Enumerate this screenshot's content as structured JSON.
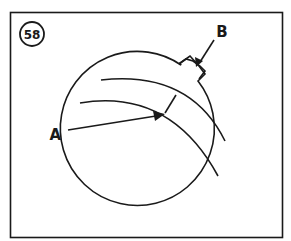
{
  "figure": {
    "number": "58",
    "labels": {
      "a": "A",
      "b": "B"
    }
  },
  "colors": {
    "ink": "#1a1a1a",
    "background": "#ffffff"
  }
}
